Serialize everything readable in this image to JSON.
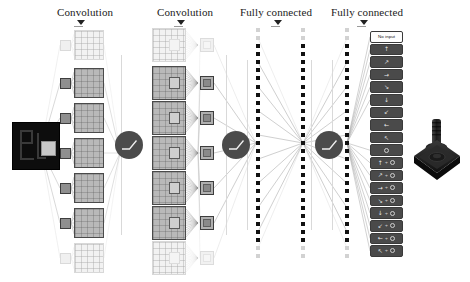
{
  "figure": {
    "background_color": "#ffffff"
  },
  "stages": [
    {
      "id": "conv1",
      "label": "Convolution",
      "marker": "down-triangle"
    },
    {
      "id": "conv2",
      "label": "Convolution",
      "marker": "down-triangle"
    },
    {
      "id": "fc1",
      "label": "Fully connected",
      "marker": "down-triangle"
    },
    {
      "id": "fc2",
      "label": "Fully connected",
      "marker": "down-triangle"
    }
  ],
  "input": {
    "name": "game-screen-frame",
    "description": "Atari game screen input frame",
    "background_color": "#0d0d0d",
    "receptive_field": {
      "color": "#c8c8c8",
      "description": "highlighted receptive field patch"
    }
  },
  "conv1": {
    "feature_map_count": 6,
    "faded_map_count": 2,
    "map_color": "#b9b9b9",
    "border_color": "#4a4a4a",
    "kernel_color": "#8f8f8f"
  },
  "conv2": {
    "feature_map_count": 6,
    "faded_map_count": 2,
    "output_square_count": 6,
    "map_color": "#b9b9b9",
    "output_color": "#b0b0b0"
  },
  "activation": {
    "name": "rectifier-nonlinearity",
    "symbol": "relu-curve",
    "count": 3,
    "color": "#4b4b4b"
  },
  "fc1": {
    "column_a_units": 29,
    "column_b_units": 29,
    "dot_color": "#111111",
    "faded_dot_color": "#d2d2d2"
  },
  "fc2": {
    "column_units": 29,
    "dot_color": "#111111"
  },
  "actions": {
    "count": 18,
    "items": [
      {
        "label": "No input",
        "glyph": "",
        "fire": false,
        "style": "light"
      },
      {
        "label": "up",
        "glyph": "↑",
        "fire": false,
        "style": "dark"
      },
      {
        "label": "up-right",
        "glyph": "↗",
        "fire": false,
        "style": "dark"
      },
      {
        "label": "right",
        "glyph": "→",
        "fire": false,
        "style": "dark"
      },
      {
        "label": "down-right",
        "glyph": "↘",
        "fire": false,
        "style": "dark"
      },
      {
        "label": "down",
        "glyph": "↓",
        "fire": false,
        "style": "dark"
      },
      {
        "label": "down-left",
        "glyph": "↙",
        "fire": false,
        "style": "dark"
      },
      {
        "label": "left",
        "glyph": "←",
        "fire": false,
        "style": "dark"
      },
      {
        "label": "up-left",
        "glyph": "↖",
        "fire": false,
        "style": "dark"
      },
      {
        "label": "fire",
        "glyph": "",
        "fire": true,
        "style": "dark"
      },
      {
        "label": "up + fire",
        "glyph": "↑",
        "fire": true,
        "style": "dark"
      },
      {
        "label": "up-right + fire",
        "glyph": "↗",
        "fire": true,
        "style": "dark"
      },
      {
        "label": "right + fire",
        "glyph": "→",
        "fire": true,
        "style": "dark"
      },
      {
        "label": "down-right + fire",
        "glyph": "↘",
        "fire": true,
        "style": "dark"
      },
      {
        "label": "down + fire",
        "glyph": "↓",
        "fire": true,
        "style": "dark"
      },
      {
        "label": "down-left + fire",
        "glyph": "↙",
        "fire": true,
        "style": "dark"
      },
      {
        "label": "left + fire",
        "glyph": "←",
        "fire": true,
        "style": "dark"
      },
      {
        "label": "up-left + fire",
        "glyph": "↖",
        "fire": true,
        "style": "dark"
      }
    ]
  },
  "controller": {
    "name": "atari-joystick",
    "description": "Atari style joystick controller",
    "color": "#1d1d1d"
  }
}
